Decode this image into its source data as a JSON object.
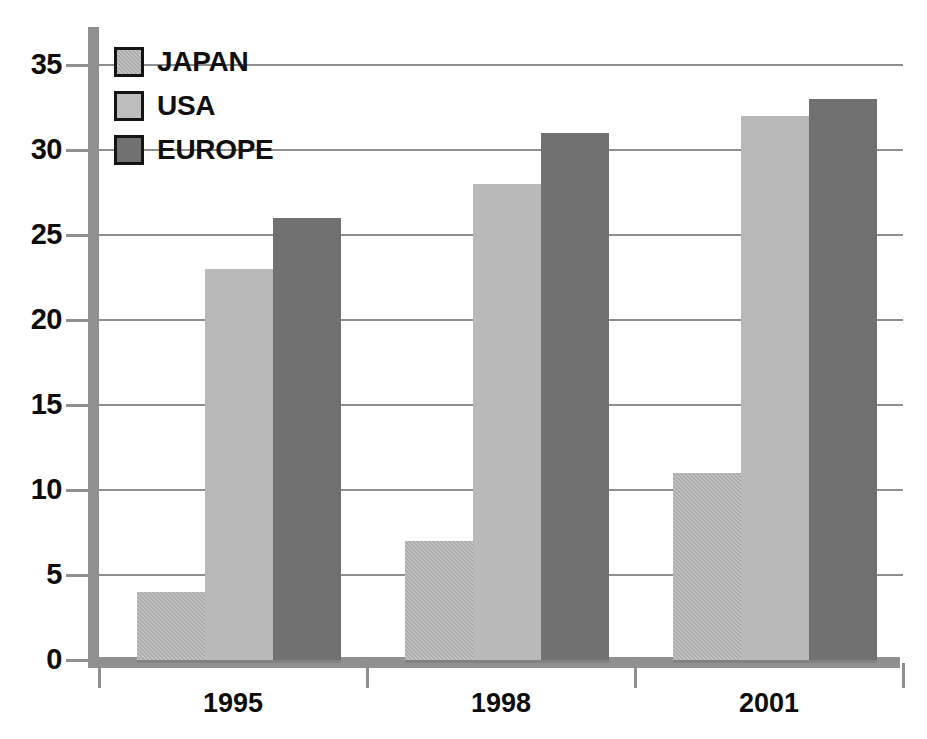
{
  "chart_data": {
    "type": "bar",
    "title": "",
    "subtitle": "",
    "xlabel": "",
    "ylabel": "",
    "categories": [
      "1995",
      "1998",
      "2001"
    ],
    "series": [
      {
        "name": "JAPAN",
        "color": "#a9a9a9",
        "values": [
          4,
          7,
          11
        ]
      },
      {
        "name": "USA",
        "color": "#bdbdbd",
        "values": [
          23,
          28,
          32
        ]
      },
      {
        "name": "EUROPE",
        "color": "#717171",
        "values": [
          26,
          31,
          33
        ]
      }
    ],
    "ylim": [
      0,
      35
    ],
    "ytick_values": [
      0,
      5,
      10,
      15,
      20,
      25,
      30,
      35
    ],
    "ytick_labels": [
      "0",
      "5",
      "10",
      "15",
      "20",
      "25",
      "30",
      "35"
    ],
    "grid": true,
    "grid_axis": "y",
    "legend": {
      "position": "top-left-inside",
      "entries": [
        "JAPAN",
        "USA",
        "EUROPE"
      ]
    },
    "background_color": "#ffffff",
    "axis_color": "#909090",
    "grid_color": "#8f8f8f",
    "text_color": "#0d0d0d"
  }
}
